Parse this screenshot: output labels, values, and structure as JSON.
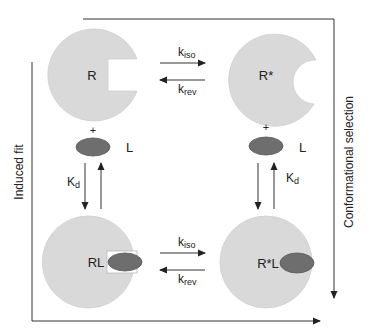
{
  "diagram": {
    "type": "receptor-ligand binding mechanism",
    "colors": {
      "receptor_fill": "#d9d9d9",
      "receptor_stroke": "#c8c8c8",
      "ligand_fill": "#6e6e6e",
      "ligand_stroke": "#555555",
      "line": "#333333",
      "text": "#222222",
      "background": "#ffffff"
    },
    "states": {
      "R": {
        "label": "R",
        "shape": "circle with rectangular notch"
      },
      "R_star": {
        "label": "R*",
        "shape": "circle with rounded notch"
      },
      "RL": {
        "label": "RL",
        "shape": "circle with rectangular notch holding ligand"
      },
      "R_star_L": {
        "label": "R*L",
        "shape": "full circle with bound ligand"
      }
    },
    "ligand": {
      "label": "L",
      "plus": "+"
    },
    "top_transition": {
      "forward": {
        "k": "k",
        "sub": "iso"
      },
      "reverse": {
        "k": "k",
        "sub": "rev"
      }
    },
    "bottom_transition": {
      "forward": {
        "k": "k",
        "sub": "iso"
      },
      "reverse": {
        "k": "k",
        "sub": "rev"
      }
    },
    "left_binding": {
      "K": "K",
      "sub": "d"
    },
    "right_binding": {
      "K": "K",
      "sub": "d"
    },
    "pathways": {
      "left": "Induced fit",
      "right": "Conformational selection"
    }
  }
}
